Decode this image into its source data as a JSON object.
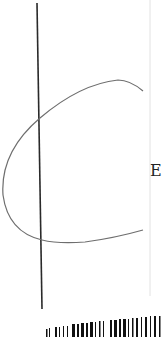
{
  "sheet": {
    "label": "E",
    "colors": {
      "background": "#ffffff",
      "vertical_line": "#2a2a2a",
      "curve": "#6e6e6e",
      "right_edge": "#dddddd",
      "barcode": "#111111"
    }
  }
}
